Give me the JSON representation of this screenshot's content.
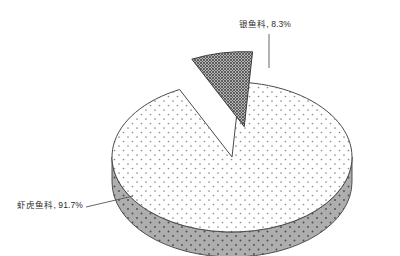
{
  "chart_data": {
    "type": "pie",
    "title": "",
    "subtitle": "",
    "xlabel": "",
    "ylabel": "",
    "legend_position": "none",
    "grid": false,
    "three_d": true,
    "categories": [
      "虾虎鱼科",
      "银鱼科"
    ],
    "values": [
      91.7,
      8.3
    ],
    "value_unit": "%",
    "slices": [
      {
        "name": "虾虎鱼科",
        "value": 91.7,
        "label": "虾虎鱼科, 91.7%",
        "percent_text": "91.7%",
        "exploded": false,
        "top_fill": "#ffffff",
        "side_fill": "#a9a9a9",
        "pattern": "fine-dots",
        "outline": "#4a4a4a"
      },
      {
        "name": "银鱼科",
        "value": 8.3,
        "label": "银鱼科, 8.3%",
        "percent_text": "8.3%",
        "exploded": true,
        "top_fill": "#8d8d8d",
        "side_fill": "#c9c9c9",
        "pattern": "cross-hatch",
        "outline": "#3c3c3c"
      }
    ],
    "annotations": [
      {
        "name": "icefish-callout",
        "text": "银鱼科, 8.3%",
        "leader": "vertical"
      },
      {
        "name": "goby-callout",
        "text": "虾虎鱼科, 91.7%",
        "leader": "diagonal"
      }
    ]
  },
  "labels": {
    "icefish": "银鱼科, 8.3%",
    "goby": "虾虎鱼科, 91.7%"
  },
  "colors": {
    "background": "#ffffff",
    "text": "#2b2b2b",
    "leader_line": "#555555",
    "pie_top": "#ffffff",
    "pie_side": "#a9a9a9",
    "slice_top": "#8d8d8d",
    "slice_side": "#c9c9c9",
    "outline": "#4a4a4a"
  }
}
